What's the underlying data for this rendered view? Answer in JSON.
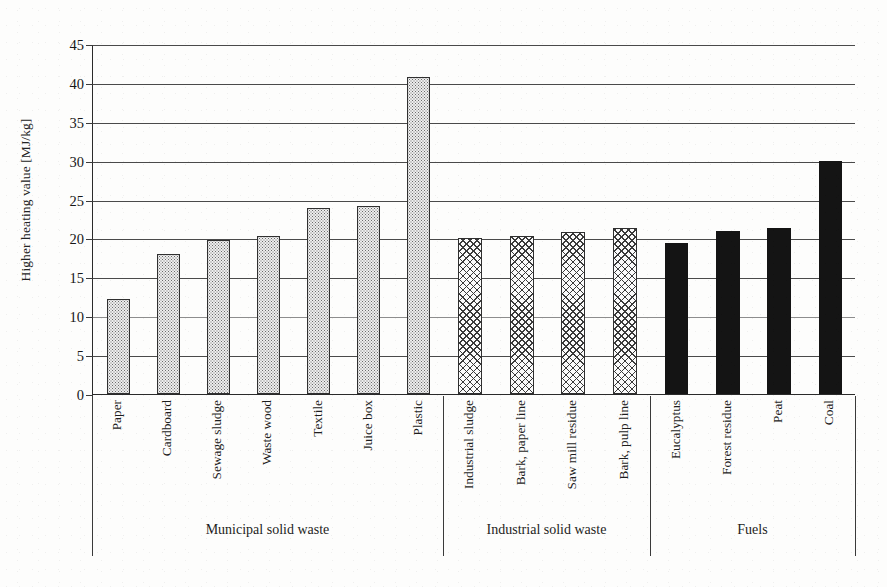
{
  "chart_data": {
    "type": "bar",
    "title": "",
    "xlabel": "",
    "ylabel": "Higher heating value [MJ/kg]",
    "ylim": [
      0,
      45
    ],
    "ytick_step": 5,
    "yticks": [
      "0",
      "5",
      "10",
      "15",
      "20",
      "25",
      "30",
      "35",
      "40",
      "45"
    ],
    "grid": true,
    "legend": "none",
    "categories": [
      "Paper",
      "Cardboard",
      "Sewage sludge",
      "Waste wood",
      "Textile",
      "Juice box",
      "Plastic",
      "Industrial sludge",
      "Bark, paper line",
      "Saw mill residue",
      "Bark, pulp line",
      "Eucalyptus",
      "Forest residue",
      "Peat",
      "Coal"
    ],
    "values": [
      12.2,
      18.0,
      19.8,
      20.3,
      23.9,
      24.2,
      40.8,
      20.1,
      20.3,
      20.8,
      21.3,
      19.4,
      20.9,
      21.4,
      30.0
    ],
    "groups": [
      {
        "label": "Municipal solid waste",
        "start": 0,
        "end": 6,
        "pattern": "dotted"
      },
      {
        "label": "Industrial solid waste",
        "start": 7,
        "end": 10,
        "pattern": "cross-hatch"
      },
      {
        "label": "Fuels",
        "start": 11,
        "end": 14,
        "pattern": "solid-black"
      }
    ],
    "bar_fill_colors": {
      "dotted": "#eeeeee",
      "cross-hatch": "#fbfbfb",
      "solid-black": "#141414"
    },
    "axis_color": "#2a2a2a",
    "gridline_color": "#4a4a4a"
  }
}
